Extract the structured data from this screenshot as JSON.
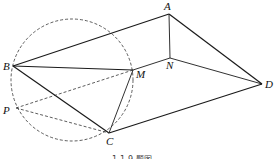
{
  "figure": {
    "caption": "1-1-9 题图",
    "points": {
      "A": {
        "label": "A",
        "x": 169,
        "y": 14
      },
      "B": {
        "label": "B",
        "x": 13,
        "y": 66
      },
      "C": {
        "label": "C",
        "x": 109,
        "y": 133
      },
      "D": {
        "label": "D",
        "x": 262,
        "y": 84
      },
      "M": {
        "label": "M",
        "x": 133,
        "y": 70
      },
      "N": {
        "label": "N",
        "x": 170,
        "y": 58
      },
      "P": {
        "label": "P",
        "x": 16,
        "y": 108
      }
    },
    "circle": {
      "cx": 72,
      "cy": 80,
      "r": 61,
      "style": "dashed"
    },
    "solid_segments": [
      "BA",
      "AD",
      "DC",
      "CB",
      "BM",
      "MN",
      "ND",
      "AN",
      "MC"
    ],
    "dashed_segments": [
      "PM",
      "PC",
      "BP"
    ]
  }
}
